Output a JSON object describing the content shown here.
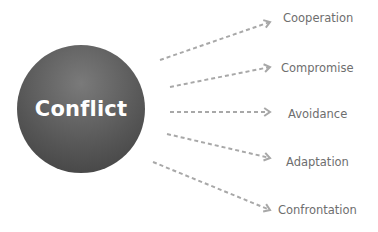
{
  "center": {
    "label": "Conflict",
    "color": "#555555"
  },
  "arrow_color": "#a8a8a8",
  "outcomes": [
    {
      "label": "Cooperation",
      "x1": 160,
      "y1": 60,
      "x2": 270,
      "y2": 22,
      "lx": 283,
      "ly": 11
    },
    {
      "label": "Compromise",
      "x1": 170,
      "y1": 87,
      "x2": 270,
      "y2": 67,
      "lx": 281,
      "ly": 61
    },
    {
      "label": "Avoidance",
      "x1": 170,
      "y1": 112,
      "x2": 270,
      "y2": 112,
      "lx": 288,
      "ly": 107
    },
    {
      "label": "Adaptation",
      "x1": 167,
      "y1": 134,
      "x2": 270,
      "y2": 158,
      "lx": 286,
      "ly": 155
    },
    {
      "label": "Confrontation",
      "x1": 153,
      "y1": 162,
      "x2": 270,
      "y2": 210,
      "lx": 278,
      "ly": 203
    }
  ]
}
